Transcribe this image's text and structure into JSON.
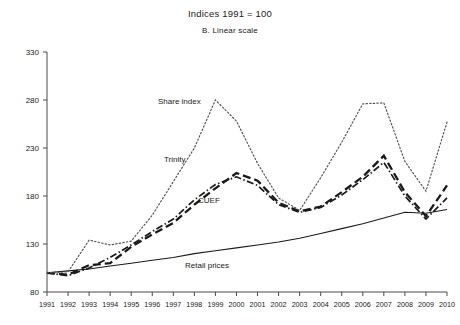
{
  "chart": {
    "title": "Indices 1991 = 100",
    "subtitle": "B. Linear scale"
  },
  "labels": {
    "share_index": "Share index",
    "trinity": "Trinity",
    "cuef": "CUEF",
    "retail_prices": "Retail prices"
  },
  "chart_data": {
    "type": "line",
    "title": "Indices 1991 = 100",
    "subtitle": "B. Linear scale",
    "xlabel": "",
    "ylabel": "",
    "ylim": [
      80,
      330
    ],
    "yticks": [
      80,
      130,
      180,
      230,
      280,
      330
    ],
    "grid": false,
    "legend_position": "inline-annotations",
    "x": [
      1991,
      1992,
      1993,
      1994,
      1995,
      1996,
      1997,
      1998,
      1999,
      2000,
      2001,
      2002,
      2003,
      2004,
      2005,
      2006,
      2007,
      2008,
      2009,
      2010
    ],
    "xticklabels": [
      "1991",
      "1992",
      "1993",
      "1994",
      "1995",
      "1996",
      "1997",
      "1998",
      "1999",
      "2000",
      "2001",
      "2002",
      "2003",
      "2004",
      "2005",
      "2006",
      "2007",
      "2008",
      "2009",
      "2010"
    ],
    "series": [
      {
        "name": "Share index",
        "style": "dotted",
        "values": [
          100,
          101,
          134,
          129,
          133,
          160,
          195,
          230,
          280,
          258,
          214,
          178,
          165,
          199,
          236,
          276,
          277,
          216,
          185,
          257
        ]
      },
      {
        "name": "Trinity",
        "style": "dashed",
        "values": [
          100,
          98,
          108,
          110,
          127,
          140,
          152,
          171,
          188,
          204,
          196,
          173,
          164,
          169,
          184,
          200,
          222,
          184,
          159,
          191
        ]
      },
      {
        "name": "CUEF",
        "style": "dash-dot",
        "values": [
          100,
          97,
          105,
          116,
          129,
          143,
          156,
          176,
          192,
          200,
          191,
          171,
          163,
          168,
          181,
          197,
          215,
          180,
          156,
          178
        ]
      },
      {
        "name": "Retail prices",
        "style": "solid",
        "values": [
          100,
          102,
          104,
          107,
          110,
          113,
          116,
          120,
          123,
          126,
          129,
          132,
          136,
          141,
          146,
          151,
          157,
          163,
          162,
          166
        ]
      }
    ]
  }
}
